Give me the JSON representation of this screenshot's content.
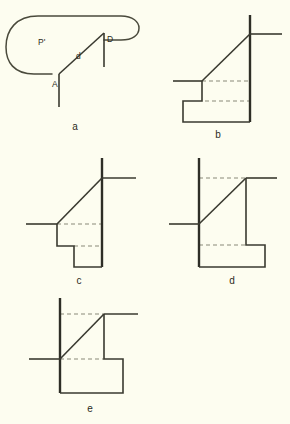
{
  "document": {
    "type": "technical-line-diagram",
    "panel_count": 5,
    "background_color": "#fdfdf0",
    "ink_color": "#3a3a30",
    "dashed_guide_color": "#8a8a78"
  },
  "panels": [
    {
      "id": "a",
      "caption": "a",
      "labels": {
        "region": "P'",
        "vertex_left": "A",
        "vertex_right": "D",
        "segment": "d"
      },
      "description": "Rounded stadium-like closed region P' with chord d drawn from vertex A up to vertex D, each vertex carrying a short vertical tick line."
    },
    {
      "id": "b",
      "caption": "b",
      "labels": {},
      "description": "Stepped profile: tall right vertical edge with crossing tick, diagonal descending left to a horizontal tick, then a downward step into a wide base box; two dashed horizontal guide lines."
    },
    {
      "id": "c",
      "caption": "c",
      "labels": {},
      "description": "Stepped profile with tall right vertical edge and crossing tick, diagonal to a horizontal tick at left, then a downward notch forming a narrow pendant box; two dashed horizontal guides."
    },
    {
      "id": "d",
      "caption": "d",
      "labels": {},
      "description": "Mirrored stepped profile: tall left vertical edge with crossing tick, diagonal ascending right to a horizontal tick, then a rightward step forming a base box; two dashed horizontal guides."
    },
    {
      "id": "e",
      "caption": "e",
      "labels": {},
      "description": "Mirrored stepped profile with tall left vertical edge and crossing tick, diagonal ascending right to a horizontal tick, then a stepped base box extending right; two dashed horizontal guides."
    }
  ]
}
